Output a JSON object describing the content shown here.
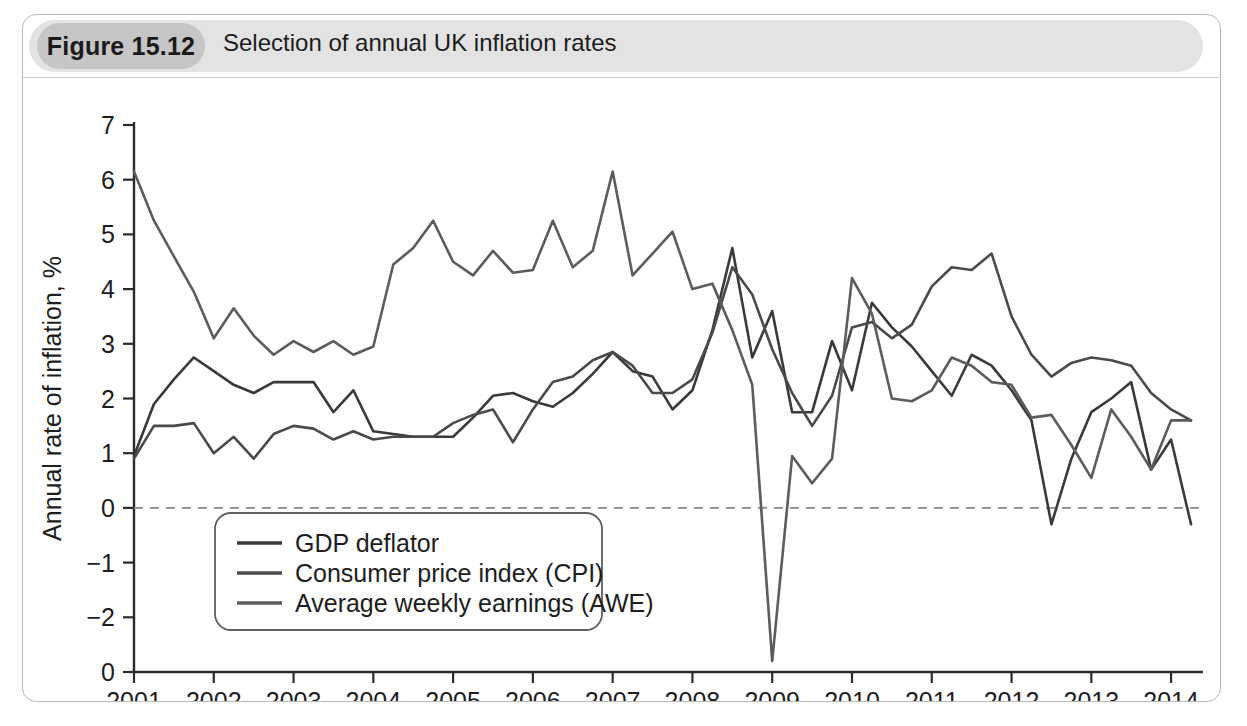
{
  "figure": {
    "badge": "Figure 15.12",
    "caption": "Selection of annual UK inflation rates"
  },
  "chart_data": {
    "type": "line",
    "title": "Selection of annual UK inflation rates",
    "xlabel": "",
    "ylabel": "Annual rate of inflation, %",
    "xlim": [
      2001.0,
      2014.4
    ],
    "ylim": [
      -3.0,
      7.0
    ],
    "grid": false,
    "zero_line": true,
    "legend_position": "lower-left-inside",
    "x_tick_labels": [
      "2001",
      "2002",
      "2003",
      "2004",
      "2005",
      "2006",
      "2007",
      "2008",
      "2009",
      "2010",
      "2011",
      "2012",
      "2013",
      "2014"
    ],
    "x_tick_values": [
      2001,
      2002,
      2003,
      2004,
      2005,
      2006,
      2007,
      2008,
      2009,
      2010,
      2011,
      2012,
      2013,
      2014
    ],
    "y_tick_labels": [
      "7",
      "6",
      "5",
      "4",
      "3",
      "2",
      "1",
      "0",
      "−1",
      "−2",
      "0"
    ],
    "y_tick_values": [
      7,
      6,
      5,
      4,
      3,
      2,
      1,
      0,
      -1,
      -2,
      -3
    ],
    "x": [
      2001.0,
      2001.25,
      2001.5,
      2001.75,
      2002.0,
      2002.25,
      2002.5,
      2002.75,
      2003.0,
      2003.25,
      2003.5,
      2003.75,
      2004.0,
      2004.25,
      2004.5,
      2004.75,
      2005.0,
      2005.25,
      2005.5,
      2005.75,
      2006.0,
      2006.25,
      2006.5,
      2006.75,
      2007.0,
      2007.25,
      2007.5,
      2007.75,
      2008.0,
      2008.25,
      2008.5,
      2008.75,
      2009.0,
      2009.25,
      2009.5,
      2009.75,
      2010.0,
      2010.25,
      2010.5,
      2010.75,
      2011.0,
      2011.25,
      2011.5,
      2011.75,
      2012.0,
      2012.25,
      2012.5,
      2012.75,
      2013.0,
      2013.25,
      2013.5,
      2013.75,
      2014.0,
      2014.25
    ],
    "series": [
      {
        "name": "GDP deflator",
        "color": "#3a3a3a",
        "width": 2.6,
        "values": [
          0.95,
          1.9,
          2.35,
          2.75,
          2.5,
          2.25,
          2.1,
          2.3,
          2.3,
          2.3,
          1.75,
          2.15,
          1.4,
          1.35,
          1.3,
          1.3,
          1.3,
          1.65,
          2.05,
          2.1,
          1.95,
          1.85,
          2.1,
          2.45,
          2.85,
          2.5,
          2.4,
          1.8,
          2.15,
          3.25,
          4.75,
          2.75,
          3.6,
          1.75,
          1.75,
          3.05,
          2.15,
          3.75,
          3.3,
          2.95,
          2.5,
          2.05,
          2.8,
          2.6,
          2.15,
          1.6,
          -0.3,
          0.9,
          1.75,
          2.0,
          2.3,
          0.7,
          1.25,
          -0.3
        ]
      },
      {
        "name": "Consumer price index (CPI)",
        "color": "#4a4a4a",
        "width": 2.6,
        "values": [
          0.9,
          1.5,
          1.5,
          1.55,
          1.0,
          1.3,
          0.9,
          1.35,
          1.5,
          1.45,
          1.25,
          1.4,
          1.25,
          1.3,
          1.3,
          1.3,
          1.55,
          1.7,
          1.8,
          1.2,
          1.8,
          2.3,
          2.4,
          2.7,
          2.85,
          2.6,
          2.1,
          2.1,
          2.35,
          3.2,
          4.4,
          3.9,
          2.9,
          2.1,
          1.5,
          2.05,
          3.3,
          3.4,
          3.1,
          3.35,
          4.05,
          4.4,
          4.35,
          4.65,
          3.5,
          2.8,
          2.4,
          2.65,
          2.75,
          2.7,
          2.6,
          2.1,
          1.8,
          1.6
        ]
      },
      {
        "name": "Average weekly earnings (AWE)",
        "color": "#5c5c5c",
        "width": 2.6,
        "values": [
          6.15,
          5.25,
          4.6,
          3.95,
          3.1,
          3.65,
          3.15,
          2.8,
          3.05,
          2.85,
          3.05,
          2.8,
          2.95,
          4.45,
          4.75,
          5.25,
          4.5,
          4.25,
          4.7,
          4.3,
          4.35,
          5.25,
          4.4,
          4.7,
          6.15,
          4.25,
          4.65,
          5.05,
          4.0,
          4.1,
          3.25,
          2.25,
          -2.8,
          0.95,
          0.45,
          0.9,
          4.2,
          3.55,
          2.0,
          1.95,
          2.15,
          2.75,
          2.6,
          2.3,
          2.25,
          1.65,
          1.7,
          1.15,
          0.55,
          1.8,
          1.3,
          0.7,
          1.6,
          1.6
        ]
      }
    ]
  }
}
